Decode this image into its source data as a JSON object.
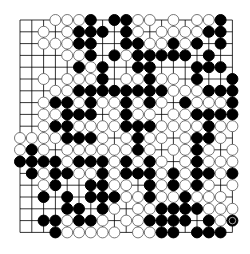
{
  "board": {
    "size": 19,
    "origin_x": 20,
    "origin_y": 20,
    "spacing": 11.8,
    "colors": {
      "background": "#ffffff",
      "line": "#000000",
      "black": "#000000",
      "white": "#ffffff"
    },
    "last_move": {
      "row": 17,
      "col": 18,
      "color": "B"
    },
    "rows": [
      "...WWWB.BBWW.W.WWB.",
      "..W.WBBB.BW.WWWWBB.",
      "..WWWBB..BBWWBWB.B.",
      "....WWB.BWBBBBB.B..",
      ".....BWB..BB...BBB.",
      "..W.WWWB.WWBWW.B..B",
      "...WWBBBBBBBBWWWBBB",
      "..WBBWBWWBWBW.BWWWB",
      "..WWBBB.WBWW.WWBBBB",
      "..WBBWWWWBBBWWWWBWW",
      "WWWWBBBW.WBWW.WBBW.",
      "WBW.WWWWWWBW.WWBW.W",
      "BBBBWBBBWBWBW.WBWWW",
      ".BWBBWWBWBBBWBWBBWB",
      "..WB..BBWW.BWBWBW.W",
      "..B.B.BBBWWBWWBWWW.",
      "....BB.BW.WWBBBBWWW",
      "..BBWBBW.WWBBBB.BWB",
      "...BWWWWW.WWBB.BBB."
    ]
  }
}
